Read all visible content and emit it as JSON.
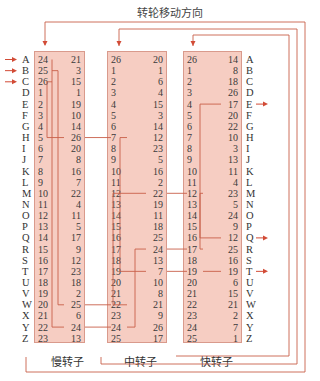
{
  "title": "转轮移动方向",
  "letters": [
    "A",
    "B",
    "C",
    "D",
    "E",
    "F",
    "G",
    "H",
    "I",
    "J",
    "K",
    "L",
    "M",
    "N",
    "O",
    "P",
    "Q",
    "R",
    "S",
    "T",
    "U",
    "V",
    "W",
    "X",
    "Y",
    "Z"
  ],
  "input_letters": [
    "A",
    "B",
    "C"
  ],
  "output_letters": [
    "E",
    "Q",
    "T"
  ],
  "rotors": [
    {
      "name": "慢转子",
      "left": [
        24,
        25,
        26,
        1,
        2,
        3,
        4,
        5,
        6,
        7,
        8,
        9,
        10,
        11,
        12,
        13,
        14,
        15,
        16,
        17,
        18,
        19,
        20,
        21,
        22,
        23
      ],
      "right": [
        21,
        3,
        15,
        1,
        19,
        10,
        14,
        26,
        20,
        8,
        16,
        7,
        22,
        4,
        11,
        5,
        17,
        9,
        12,
        23,
        18,
        2,
        25,
        6,
        24,
        13
      ]
    },
    {
      "name": "中转子",
      "left": [
        26,
        1,
        2,
        3,
        4,
        5,
        6,
        7,
        8,
        9,
        10,
        11,
        12,
        13,
        14,
        15,
        16,
        17,
        18,
        19,
        20,
        21,
        22,
        23,
        24,
        25
      ],
      "right": [
        20,
        1,
        6,
        4,
        15,
        3,
        14,
        12,
        23,
        5,
        16,
        2,
        22,
        19,
        11,
        18,
        25,
        24,
        13,
        7,
        10,
        8,
        21,
        9,
        26,
        17
      ]
    },
    {
      "name": "快转子",
      "left": [
        26,
        1,
        2,
        3,
        4,
        5,
        6,
        7,
        8,
        9,
        10,
        11,
        12,
        13,
        14,
        15,
        16,
        17,
        18,
        19,
        20,
        21,
        22,
        23,
        24,
        25
      ],
      "right": [
        14,
        8,
        18,
        26,
        17,
        20,
        22,
        10,
        3,
        13,
        11,
        4,
        23,
        5,
        24,
        9,
        12,
        25,
        16,
        19,
        6,
        15,
        21,
        2,
        7,
        1
      ]
    }
  ],
  "wiring": [
    {
      "rotor": 0,
      "from_row": 0,
      "to_row": 24
    },
    {
      "rotor": 0,
      "from_row": 1,
      "to_row": 22
    },
    {
      "rotor": 0,
      "from_row": 2,
      "to_row": 7
    },
    {
      "rotor": 1,
      "from_row": 7,
      "to_row": 19
    },
    {
      "rotor": 1,
      "from_row": 22,
      "to_row": 12
    },
    {
      "rotor": 1,
      "from_row": 24,
      "to_row": 17
    },
    {
      "rotor": 2,
      "from_row": 12,
      "to_row": 16
    },
    {
      "rotor": 2,
      "from_row": 17,
      "to_row": 4
    },
    {
      "rotor": 2,
      "from_row": 19,
      "to_row": 19
    }
  ],
  "colors": {
    "rotor_fill": "#f6cdc2",
    "rotor_border": "#d99a8c",
    "line": "#c8604a",
    "arrow": "#d24b36"
  }
}
